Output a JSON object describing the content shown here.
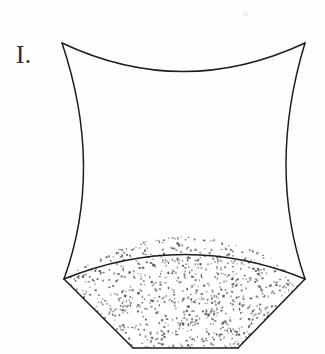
{
  "figure": {
    "label": "I.",
    "caption": "",
    "background_color": "#fefefe",
    "stroke_color": "#1d1d1d",
    "stipple_color": "#555555",
    "stroke_width": 1.5,
    "description_name": "hyperboloid-vessel-with-granular-base"
  },
  "geometry": {
    "top_left_vertex": [
      62,
      43
    ],
    "top_right_vertex": [
      305,
      43
    ],
    "bottom_left_vertex": [
      64,
      279
    ],
    "bottom_right_vertex": [
      305,
      279
    ],
    "base_bottom_left": [
      133,
      348
    ],
    "base_bottom_right": [
      238,
      348
    ],
    "top_rim_dip_y": 81,
    "side_waist_left_x": 100,
    "side_waist_right_x": 272,
    "side_waist_y": 168,
    "fill_arc_peak": [
      185,
      243
    ],
    "paths": {
      "top_rim": "M62,43 Q183,100 305,43",
      "left_side": "M62,43 Q104,168 64,279",
      "right_side": "M305,43 Q267,168 305,279",
      "fill_surface_arc": "M64,279 Q185,230 305,279",
      "base_left_edge": "M64,279 L133,348",
      "base_right_edge": "M305,279 L238,348",
      "base_bottom_edge": "M133,348 L238,348"
    }
  },
  "stipple": {
    "dot_count": 1300,
    "dot_size_min": 1,
    "dot_size_max": 2.4,
    "seed": 20240117
  }
}
